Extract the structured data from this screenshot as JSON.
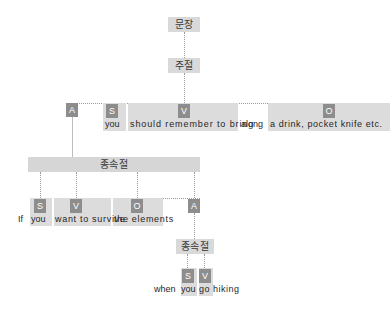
{
  "diagram": {
    "title_node": "문장",
    "main_clause_node": "주절",
    "sub_clause_node_1": "종속절",
    "sub_clause_node_2": "종속절",
    "colors": {
      "badge": "#8d8d8d",
      "node": "#d9d9d9",
      "block": "#dcdcdc",
      "line": "#9a9a9a",
      "text": "#1f1f1f"
    },
    "main_row": {
      "badges": {
        "adverbial": "A",
        "subject": "S",
        "verb": "V",
        "object": "O"
      },
      "words": {
        "subject": "you",
        "verb": "should remember to bring",
        "particle": "along",
        "object": "a drink, pocket knife etc."
      }
    },
    "sub_row_1": {
      "badges": {
        "subject": "S",
        "verb": "V",
        "object": "O",
        "adverbial": "A"
      },
      "words": {
        "conjunction": "If",
        "subject": "you",
        "verb": "want to survive",
        "object": "the elements"
      }
    },
    "sub_row_2": {
      "badges": {
        "subject": "S",
        "verb": "V"
      },
      "words": {
        "conjunction": "when",
        "subject": "you",
        "verb": "go hiking"
      }
    }
  }
}
